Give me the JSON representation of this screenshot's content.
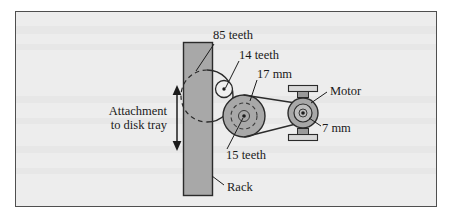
{
  "figure": {
    "type": "mechanical-diagram",
    "background_color": "#eeeeee",
    "frame_border_color": "#4a4a4a",
    "part_fill_color": "#a6a6a6",
    "part_outline_color": "#2b2b2b",
    "white_fill_color": "#f2f2f2"
  },
  "labels": {
    "gear_85": "85 teeth",
    "gear_14": "14 teeth",
    "pulley_17mm": "17 mm",
    "gear_15": "15 teeth",
    "motor": "Motor",
    "pulley_7mm": "7 mm",
    "rack": "Rack",
    "attachment_line1": "Attachment",
    "attachment_line2": "to disk tray"
  },
  "components": [
    {
      "name": "rack",
      "label": "Rack",
      "shape": "vertical-bar",
      "x": 183,
      "y": 42,
      "width": 29,
      "height": 154
    },
    {
      "name": "gear-85-teeth",
      "label": "85 teeth",
      "shape": "circle",
      "cx": 207,
      "cy": 96,
      "r": 26,
      "teeth": 85
    },
    {
      "name": "gear-14-teeth",
      "label": "14 teeth",
      "shape": "circle",
      "cx": 224,
      "cy": 89,
      "r": 8,
      "teeth": 14
    },
    {
      "name": "pulley-17mm",
      "label": "17 mm",
      "shape": "circle",
      "cx": 244,
      "cy": 116,
      "r": 21,
      "diameter_mm": 17
    },
    {
      "name": "gear-15-teeth",
      "label": "15 teeth",
      "shape": "dashed-circle",
      "cx": 244,
      "cy": 116,
      "r": 13,
      "teeth": 15
    },
    {
      "name": "motor",
      "label": "Motor",
      "shape": "circle",
      "cx": 303,
      "cy": 113,
      "r": 15
    },
    {
      "name": "pulley-7mm",
      "label": "7 mm",
      "shape": "circle",
      "cx": 303,
      "cy": 113,
      "r": 9,
      "diameter_mm": 7
    },
    {
      "name": "belt",
      "label": "belt",
      "shape": "tangent-lines"
    },
    {
      "name": "attachment-arrow",
      "label": "Attachment to disk tray",
      "shape": "double-headed-arrow",
      "x": 177,
      "y_top": 86,
      "y_bottom": 150
    }
  ]
}
